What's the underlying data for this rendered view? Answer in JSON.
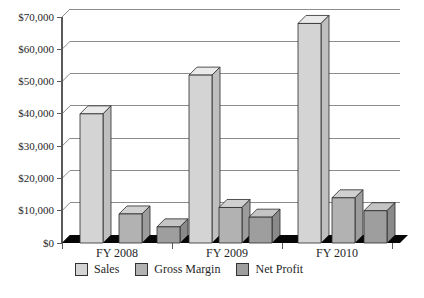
{
  "chart_data": {
    "type": "bar",
    "style": "3d-column",
    "title": "",
    "xlabel": "",
    "ylabel": "",
    "categories": [
      "FY 2008",
      "FY 2009",
      "FY 2010"
    ],
    "series": [
      {
        "name": "Sales",
        "values": [
          40000,
          52000,
          68000
        ],
        "color": {
          "front": "#d4d4d4",
          "top": "#eaeaea",
          "side": "#bfbfbf"
        }
      },
      {
        "name": "Gross Margin",
        "values": [
          9000,
          11000,
          14000
        ],
        "color": {
          "front": "#b2b2b2",
          "top": "#d0d0d0",
          "side": "#9c9c9c"
        }
      },
      {
        "name": "Net Profit",
        "values": [
          5000,
          8000,
          10000
        ],
        "color": {
          "front": "#9e9e9e",
          "top": "#c4c4c4",
          "side": "#8a8a8a"
        }
      }
    ],
    "y_axis": {
      "min": 0,
      "max": 70000,
      "tick_step": 10000,
      "tick_labels": [
        "$0",
        "$10,000",
        "$20,000",
        "$30,000",
        "$40,000",
        "$50,000",
        "$60,000",
        "$70,000"
      ]
    },
    "legend": {
      "position": "bottom",
      "entries": [
        "Sales",
        "Gross Margin",
        "Net Profit"
      ]
    },
    "grid": true,
    "colors": {
      "gridline": "#8c8c8c",
      "axis": "#5a5a5a",
      "floor": "#060606",
      "outline": "#2a2a2a",
      "text": "#1f1f1f",
      "background": "#ffffff"
    }
  }
}
